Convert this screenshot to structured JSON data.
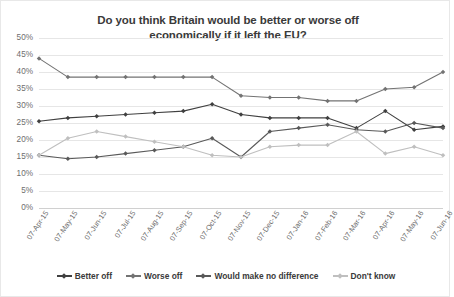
{
  "chart_data": {
    "type": "line",
    "title": "Do you think Britain would be better or worse off economically if it left the EU?",
    "title_line1": "Do you think Britain would be better or worse off",
    "title_line2": "economically if it left the EU?",
    "xlabel": "",
    "ylabel": "",
    "ylim": [
      0,
      50
    ],
    "ytick_step": 5,
    "ytick_labels": [
      "50%",
      "45%",
      "40%",
      "35%",
      "30%",
      "25%",
      "20%",
      "15%",
      "10%",
      "5%",
      "0%"
    ],
    "ytick_values": [
      50,
      45,
      40,
      35,
      30,
      25,
      20,
      15,
      10,
      5,
      0
    ],
    "grid": true,
    "legend_position": "bottom",
    "categories": [
      "07-Apr-15",
      "07-May-15",
      "07-Jun-15",
      "07-Jul-15",
      "07-Aug-15",
      "07-Sep-15",
      "07-Oct-15",
      "07-Nov-15",
      "07-Dec-15",
      "07-Jan-16",
      "07-Feb-16",
      "07-Mar-16",
      "07-Apr-16",
      "07-May-16",
      "07-Jun-16"
    ],
    "series": [
      {
        "name": "Better off",
        "color": "#404040",
        "values": [
          25.5,
          26.5,
          27.0,
          27.5,
          28.0,
          28.5,
          30.5,
          27.5,
          26.5,
          26.5,
          26.5,
          23.5,
          28.5,
          23.0,
          24.0
        ]
      },
      {
        "name": "Worse off",
        "color": "#737373",
        "values": [
          44.0,
          38.5,
          38.5,
          38.5,
          38.5,
          38.5,
          38.5,
          33.0,
          32.5,
          32.5,
          31.5,
          31.5,
          35.0,
          35.5,
          40.0
        ]
      },
      {
        "name": "Would make no difference",
        "color": "#595959",
        "values": [
          15.5,
          14.5,
          15.0,
          16.0,
          17.0,
          18.0,
          20.5,
          15.0,
          22.5,
          23.5,
          24.5,
          23.0,
          22.5,
          25.0,
          23.5
        ]
      },
      {
        "name": "Don't know",
        "color": "#bfbfbf",
        "values": [
          15.5,
          20.5,
          22.5,
          21.0,
          19.5,
          18.0,
          15.5,
          15.0,
          18.0,
          18.5,
          18.5,
          22.5,
          16.0,
          18.0,
          15.5
        ]
      }
    ]
  }
}
